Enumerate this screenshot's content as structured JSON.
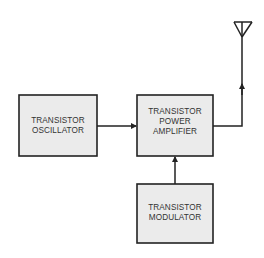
{
  "diagram": {
    "type": "block-diagram",
    "blocks": {
      "oscillator": {
        "lines": [
          "TRANSISTOR",
          "OSCILLATOR"
        ]
      },
      "amplifier": {
        "lines": [
          "TRANSISTOR",
          "POWER",
          "AMPLIFIER"
        ]
      },
      "modulator": {
        "lines": [
          "TRANSISTOR",
          "MODULATOR"
        ]
      }
    },
    "connections": [
      {
        "from": "oscillator",
        "to": "amplifier"
      },
      {
        "from": "modulator",
        "to": "amplifier"
      },
      {
        "from": "amplifier",
        "to": "antenna"
      }
    ],
    "antenna": {
      "icon": "antenna-icon"
    }
  }
}
